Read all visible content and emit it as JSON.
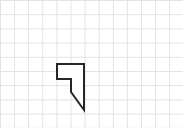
{
  "canvas": {
    "width": 183,
    "height": 128,
    "background_color": "#ffffff"
  },
  "grid": {
    "visible": true,
    "cell_width": 14.1,
    "cell_height": 14.2,
    "line_color": "#e2e2e6",
    "line_width": 1,
    "columns": 13,
    "rows": 9
  },
  "shape": {
    "name": "notched-polygon",
    "kind": "polygon",
    "vertex_count": 6,
    "points": "57,64 84,64 84,110 71,92 71,79 57,79",
    "fill_color": "#fdfdfd",
    "stroke_color": "#262626",
    "stroke_width": 2,
    "vertices": [
      {
        "label": "A",
        "x": 57,
        "y": 64
      },
      {
        "label": "B",
        "x": 84,
        "y": 64
      },
      {
        "label": "C",
        "x": 84,
        "y": 110
      },
      {
        "label": "D",
        "x": 71,
        "y": 92
      },
      {
        "label": "E",
        "x": 71,
        "y": 79
      },
      {
        "label": "F",
        "x": 57,
        "y": 79
      }
    ],
    "edges": [
      {
        "from": "A",
        "to": "B",
        "type": "horizontal"
      },
      {
        "from": "B",
        "to": "C",
        "type": "vertical"
      },
      {
        "from": "C",
        "to": "D",
        "type": "diagonal"
      },
      {
        "from": "D",
        "to": "E",
        "type": "vertical"
      },
      {
        "from": "E",
        "to": "F",
        "type": "horizontal"
      },
      {
        "from": "F",
        "to": "A",
        "type": "vertical"
      }
    ]
  }
}
